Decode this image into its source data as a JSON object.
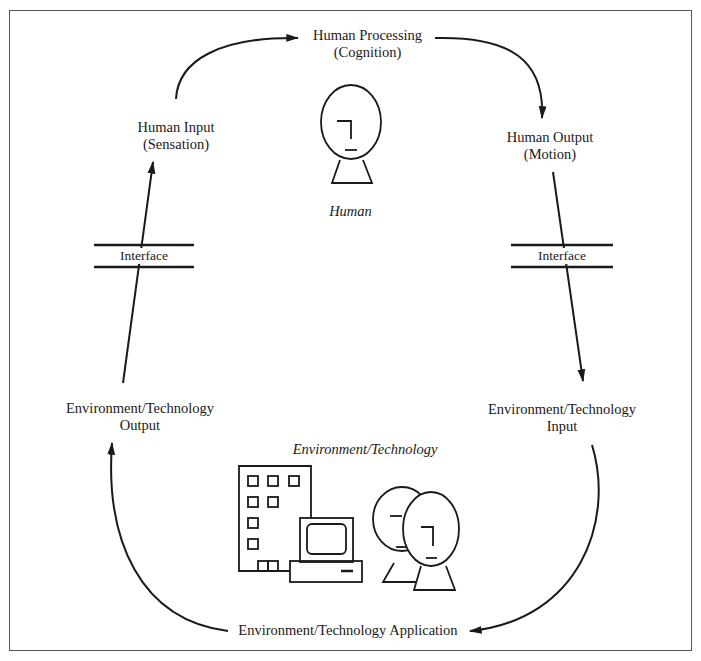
{
  "diagram": {
    "type": "cycle",
    "nodes": {
      "human_processing": {
        "line1": "Human Processing",
        "line2": "(Cognition)"
      },
      "human_input": {
        "line1": "Human Input",
        "line2": "(Sensation)"
      },
      "human_output": {
        "line1": "Human Output",
        "line2": "(Motion)"
      },
      "env_output": {
        "line1": "Environment/Technology",
        "line2": "Output"
      },
      "env_input": {
        "line1": "Environment/Technology",
        "line2": "Input"
      },
      "env_application": {
        "line1": "Environment/Technology Application"
      }
    },
    "interfaces": {
      "left": "Interface",
      "right": "Interface"
    },
    "captions": {
      "human": "Human",
      "environment": "Environment/Technology"
    },
    "icons": [
      "human-head-icon",
      "office-building-icon",
      "computer-terminal-icon",
      "two-people-heads-icon"
    ],
    "flow": [
      "Human Input (Sensation) -> Human Processing (Cognition)",
      "Human Processing (Cognition) -> Human Output (Motion)",
      "Human Output (Motion) -> [Interface] -> Environment/Technology Input",
      "Environment/Technology Input -> Environment/Technology Application",
      "Environment/Technology Application -> Environment/Technology Output",
      "Environment/Technology Output -> [Interface] -> Human Input (Sensation)"
    ],
    "colors": {
      "line": "#1a1a1a",
      "frame": "#555555",
      "background": "#ffffff"
    }
  }
}
